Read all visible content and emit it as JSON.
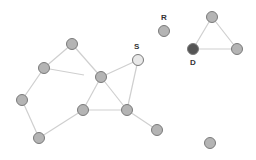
{
  "diagram": {
    "type": "graph",
    "colors": {
      "edge": "#cfcfcf",
      "node_default": "#b4b4b4",
      "node_source": "#e8e8e8",
      "node_destination": "#555555",
      "node_stroke": "#7a7a7a",
      "label": "#333333"
    },
    "nodes": [
      {
        "id": "A",
        "x": 72,
        "y": 44,
        "label": "",
        "role": "default"
      },
      {
        "id": "B",
        "x": 44,
        "y": 68,
        "label": "",
        "role": "default"
      },
      {
        "id": "C",
        "x": 101,
        "y": 77,
        "label": "",
        "role": "default"
      },
      {
        "id": "S",
        "x": 138,
        "y": 60,
        "label": "S",
        "role": "source"
      },
      {
        "id": "R",
        "x": 164,
        "y": 31,
        "label": "R",
        "role": "default"
      },
      {
        "id": "E",
        "x": 22,
        "y": 100,
        "label": "",
        "role": "default"
      },
      {
        "id": "F",
        "x": 83,
        "y": 110,
        "label": "",
        "role": "default"
      },
      {
        "id": "G",
        "x": 127,
        "y": 110,
        "label": "",
        "role": "default"
      },
      {
        "id": "H",
        "x": 39,
        "y": 138,
        "label": "",
        "role": "default"
      },
      {
        "id": "I",
        "x": 157,
        "y": 130,
        "label": "",
        "role": "default"
      },
      {
        "id": "J",
        "x": 210,
        "y": 143,
        "label": "",
        "role": "default"
      },
      {
        "id": "T1",
        "x": 212,
        "y": 17,
        "label": "",
        "role": "default"
      },
      {
        "id": "D",
        "x": 193,
        "y": 49,
        "label": "D",
        "role": "destination"
      },
      {
        "id": "T2",
        "x": 237,
        "y": 49,
        "label": "",
        "role": "default"
      }
    ],
    "edges": [
      {
        "from": "A",
        "to": "B"
      },
      {
        "from": "A",
        "to": "C"
      },
      {
        "from": "B",
        "to": "C",
        "partial": true,
        "end_x": 84,
        "end_y": 75
      },
      {
        "from": "B",
        "to": "E"
      },
      {
        "from": "E",
        "to": "H"
      },
      {
        "from": "H",
        "to": "F"
      },
      {
        "from": "F",
        "to": "C"
      },
      {
        "from": "F",
        "to": "G"
      },
      {
        "from": "C",
        "to": "G"
      },
      {
        "from": "C",
        "to": "S"
      },
      {
        "from": "S",
        "to": "G"
      },
      {
        "from": "G",
        "to": "I"
      },
      {
        "from": "T1",
        "to": "D"
      },
      {
        "from": "T1",
        "to": "T2"
      },
      {
        "from": "D",
        "to": "T2"
      }
    ],
    "labels": [
      {
        "text": "S",
        "x": 134,
        "y": 43
      },
      {
        "text": "R",
        "x": 161,
        "y": 14
      },
      {
        "text": "D",
        "x": 190,
        "y": 59
      }
    ]
  }
}
